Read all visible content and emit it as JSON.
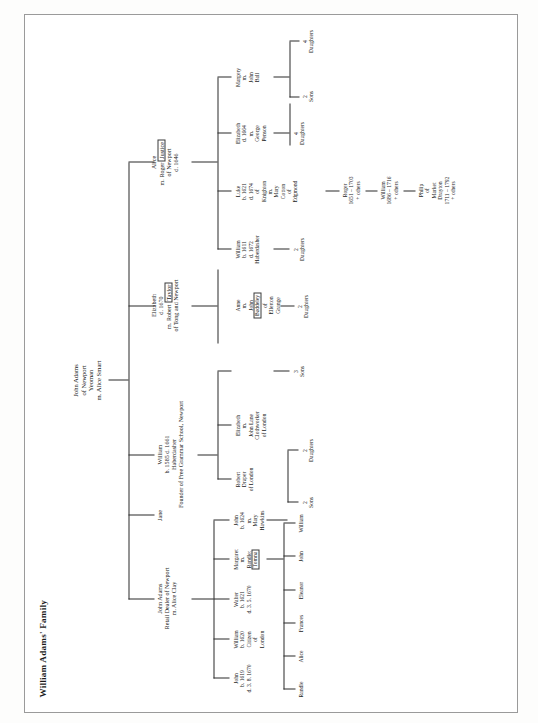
{
  "title": "William Adams' Family",
  "page": {
    "orientation": "rotated-90",
    "background": "#ffffff",
    "line_color": "#2a2a2a"
  },
  "tree": {
    "root": {
      "name": "root-john-adams",
      "lines": [
        "John Adams",
        "of Newport",
        "Yeoman",
        "m. Alice Smart"
      ]
    },
    "generation2": [
      {
        "name": "john-adams-retail-dealer",
        "lines": [
          "John Adams",
          "Retail Dealer of Newport",
          "m. Alice Clay"
        ]
      },
      {
        "name": "jane",
        "lines": [
          "Jane"
        ]
      },
      {
        "name": "william-b1585",
        "lines": [
          "William",
          "b. 1585   d. 1661",
          "Haberdasher",
          "Founder of Free Grammar School, Newport"
        ]
      },
      {
        "name": "elizabeth-d1670",
        "lines": [
          "Elizabeth",
          "d. 1670",
          "m. Robert",
          "of Tong and Newport"
        ],
        "boxed": "Taylor",
        "boxed_after_line": 2
      },
      {
        "name": "alice-m-roger",
        "lines": [
          "Alice",
          "m. Roger",
          "of Newport",
          "d. 1646"
        ],
        "boxed": "Justice",
        "boxed_after_line": 1
      }
    ],
    "generation3": [
      {
        "name": "john-b1619",
        "lines": [
          "John",
          "b. 1619",
          "d. 3. 8. 1670"
        ]
      },
      {
        "name": "william-b1620",
        "lines": [
          "William",
          "b. 1620",
          "Citizen",
          "of",
          "London"
        ]
      },
      {
        "name": "walter-b1621",
        "lines": [
          "Walter",
          "b. 1621",
          "d. 3. 5. 1670"
        ]
      },
      {
        "name": "margaret-m-randle",
        "lines": [
          "Margaret",
          "m.",
          "Randle:"
        ],
        "boxed": "Tomna"
      },
      {
        "name": "john-b1624",
        "lines": [
          "John",
          "b. 1624",
          "m.",
          "Mary",
          "Hawkins"
        ]
      },
      {
        "name": "robert-draper",
        "lines": [
          "Robert",
          "Draper",
          "of London"
        ]
      },
      {
        "name": "elizabeth-m-john-lane",
        "lines": [
          "Elizabeth",
          "m.",
          "John Lane",
          "Clothworker",
          "of London"
        ]
      },
      {
        "name": "anne-m-john-baddeley",
        "lines": [
          "Anne",
          "m.",
          "John"
        ],
        "boxed": "Baddeley",
        "tail": [
          "of",
          "Ellerton",
          "Grange"
        ]
      },
      {
        "name": "william-b1611",
        "lines": [
          "William",
          "b. 1611",
          "d. 1672",
          "Haberdasher"
        ]
      },
      {
        "name": "luke-b1621",
        "lines": [
          "Luke",
          "b. 1621",
          "d. 1674",
          "of",
          "Knighton",
          "m.",
          "Mary",
          "Cotton",
          "of",
          "Edgmond"
        ]
      },
      {
        "name": "elizabeth-d1664",
        "lines": [
          "Elizabeth",
          "d. 1664",
          "m.",
          "George",
          "Penson"
        ]
      },
      {
        "name": "margery-m-john-ball",
        "lines": [
          "Margery",
          "m.",
          "John",
          "Ball"
        ]
      }
    ],
    "generation4": [
      {
        "name": "randle",
        "lines": [
          "Randle"
        ]
      },
      {
        "name": "alice",
        "lines": [
          "Alice"
        ]
      },
      {
        "name": "frances",
        "lines": [
          "Frances"
        ]
      },
      {
        "name": "eleanor",
        "lines": [
          "Eleanor"
        ]
      },
      {
        "name": "john",
        "lines": [
          "John"
        ]
      },
      {
        "name": "william",
        "lines": [
          "William"
        ]
      },
      {
        "name": "count-2-sons-a",
        "lines": [
          "2",
          "Sons"
        ]
      },
      {
        "name": "count-2-daughters-a",
        "lines": [
          "2",
          "Daughters"
        ]
      },
      {
        "name": "count-3-sons",
        "lines": [
          "3",
          "Sons"
        ]
      },
      {
        "name": "count-2-daughters-b",
        "lines": [
          "2",
          "Daughters"
        ]
      },
      {
        "name": "count-2-daughters-c",
        "lines": [
          "2",
          "Daughters"
        ]
      },
      {
        "name": "count-4-daughters",
        "lines": [
          "4",
          "Daughters"
        ]
      },
      {
        "name": "count-2-sons-b",
        "lines": [
          "2",
          "Sons"
        ]
      },
      {
        "name": "count-4-daughters-b",
        "lines": [
          "4",
          "Daughters"
        ]
      }
    ],
    "descent_line": [
      {
        "name": "roger-1651",
        "lines": [
          "Roger",
          "1651 – 1703",
          "+ others"
        ]
      },
      {
        "name": "william-1686",
        "lines": [
          "William",
          "1686 – 1716",
          "+ others"
        ]
      },
      {
        "name": "philip-market-drayton",
        "lines": [
          "Philip",
          "of",
          "Market",
          "Drayton",
          "1711 – 1792",
          "+ others"
        ]
      }
    ]
  }
}
